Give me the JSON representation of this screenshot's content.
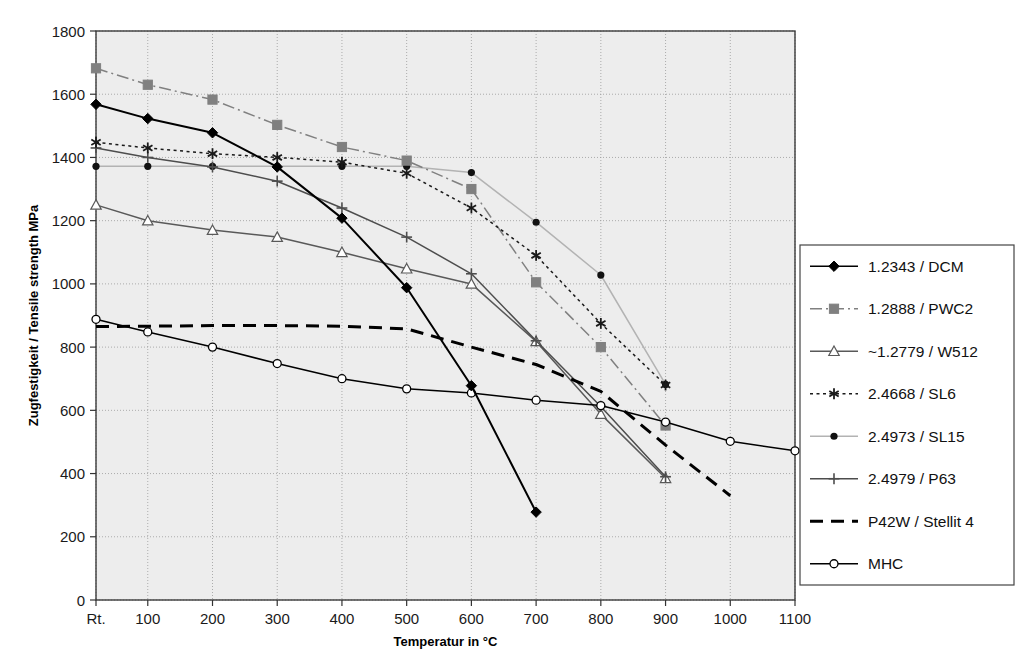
{
  "chart_data": {
    "type": "line",
    "title": "",
    "xlabel": "Temperatur in °C",
    "ylabel": "Zugfestigkeit / Tensile strength MPa",
    "x_tick_labels": [
      "Rt.",
      "100",
      "200",
      "300",
      "400",
      "500",
      "600",
      "700",
      "800",
      "900",
      "1000",
      "1100"
    ],
    "x_values": [
      20,
      100,
      200,
      300,
      400,
      500,
      600,
      700,
      800,
      900,
      1000,
      1100
    ],
    "y_tick_labels": [
      "0",
      "200",
      "400",
      "600",
      "800",
      "1000",
      "1200",
      "1400",
      "1600",
      "1800"
    ],
    "ylim": [
      0,
      1800
    ],
    "xlim": [
      20,
      1100
    ],
    "y_tick_step": 200,
    "grid": true,
    "legend_position": "right",
    "series": [
      {
        "name": "1.2343 / DCM",
        "color": "#000000",
        "marker": "diamond",
        "dash": "solid",
        "x": [
          20,
          100,
          200,
          300,
          400,
          500,
          600,
          700
        ],
        "values": [
          1568,
          1523,
          1478,
          1370,
          1208,
          988,
          678,
          278
        ]
      },
      {
        "name": "1.2888 / PWC2",
        "color": "#808080",
        "marker": "square",
        "dash": "dashdot",
        "x": [
          20,
          100,
          200,
          300,
          400,
          500,
          600,
          700,
          800,
          900
        ],
        "values": [
          1682,
          1630,
          1583,
          1503,
          1433,
          1390,
          1300,
          1005,
          800,
          552
        ]
      },
      {
        "name": "~1.2779 / W512",
        "color": "#595959",
        "marker": "triangle",
        "dash": "solid",
        "x": [
          20,
          100,
          200,
          300,
          400,
          500,
          600,
          700,
          800,
          900
        ],
        "values": [
          1250,
          1200,
          1170,
          1148,
          1100,
          1048,
          1000,
          818,
          588,
          385
        ]
      },
      {
        "name": "2.4668 / SL6",
        "color": "#1a1a1a",
        "marker": "asterisk",
        "dash": "dotted",
        "x": [
          20,
          100,
          200,
          300,
          400,
          500,
          600,
          700,
          800,
          900
        ],
        "values": [
          1448,
          1430,
          1412,
          1400,
          1385,
          1350,
          1240,
          1090,
          875,
          680
        ]
      },
      {
        "name": "2.4973 / SL15",
        "color": "#b3b3b3",
        "marker": "dot",
        "dash": "solid",
        "x": [
          20,
          100,
          200,
          300,
          400,
          500,
          600,
          700,
          800,
          900
        ],
        "values": [
          1372,
          1372,
          1372,
          1372,
          1372,
          1372,
          1352,
          1195,
          1028,
          682
        ]
      },
      {
        "name": "2.4979 / P63",
        "color": "#4d4d4d",
        "marker": "plus",
        "dash": "solid",
        "x": [
          20,
          100,
          200,
          300,
          400,
          500,
          600,
          700,
          800,
          900
        ],
        "values": [
          1430,
          1400,
          1370,
          1325,
          1240,
          1148,
          1032,
          820,
          612,
          390
        ]
      },
      {
        "name": "P42W / Stellit 4",
        "color": "#000000",
        "marker": "none",
        "dash": "dashed",
        "x": [
          20,
          100,
          200,
          300,
          400,
          500,
          600,
          700,
          800,
          900,
          1000
        ],
        "values": [
          865,
          866,
          868,
          868,
          866,
          858,
          800,
          745,
          660,
          490,
          330
        ]
      },
      {
        "name": "MHC",
        "color": "#000000",
        "marker": "circle",
        "dash": "solid",
        "x": [
          20,
          100,
          200,
          300,
          400,
          500,
          600,
          700,
          800,
          900,
          1000,
          1100
        ],
        "values": [
          888,
          848,
          800,
          748,
          700,
          668,
          655,
          632,
          615,
          563,
          502,
          472
        ]
      }
    ]
  },
  "plot": {
    "bg_color": "#ededed",
    "grid_color": "#9a9a9a",
    "border_color": "#3a3a3a"
  }
}
